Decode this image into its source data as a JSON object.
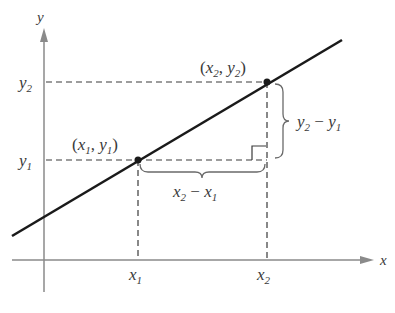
{
  "diagram": {
    "axes": {
      "x_label": "x",
      "y_label": "y"
    },
    "ticks": {
      "x1": {
        "base": "x",
        "sub": "1"
      },
      "x2": {
        "base": "x",
        "sub": "2"
      },
      "y1": {
        "base": "y",
        "sub": "1"
      },
      "y2": {
        "base": "y",
        "sub": "2"
      }
    },
    "points": [
      {
        "label_open": "(",
        "xbase": "x",
        "xsub": "1",
        "comma": ", ",
        "ybase": "y",
        "ysub": "1",
        "label_close": ")"
      },
      {
        "label_open": "(",
        "xbase": "x",
        "xsub": "2",
        "comma": ", ",
        "ybase": "y",
        "ysub": "2",
        "label_close": ")"
      }
    ],
    "brace_labels": {
      "rise": {
        "a": "y",
        "a_sub": "2",
        "minus": " − ",
        "b": "y",
        "b_sub": "1"
      },
      "run": {
        "a": "x",
        "a_sub": "2",
        "minus": " − ",
        "b": "x",
        "b_sub": "1"
      }
    },
    "colors": {
      "line": "#1a1a1a",
      "axis": "#8a8a8a",
      "text": "#3a3a3a"
    }
  }
}
